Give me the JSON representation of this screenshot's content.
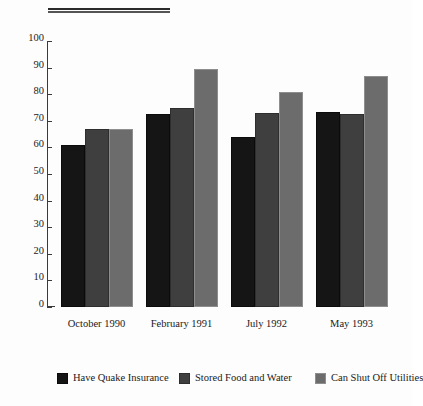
{
  "chart_data": {
    "type": "bar",
    "title": "",
    "subtitle": "",
    "xlabel": "",
    "ylabel": "",
    "ylim": [
      0,
      100
    ],
    "yticks": [
      0,
      10,
      20,
      30,
      40,
      50,
      60,
      70,
      80,
      90,
      100
    ],
    "grid": false,
    "legend_position": "bottom",
    "categories": [
      "October 1990",
      "February 1991",
      "July 1992",
      "May 1993"
    ],
    "series": [
      {
        "name": "Have Quake Insurance",
        "color": "#151515",
        "values": [
          61,
          72.5,
          64,
          73.5
        ]
      },
      {
        "name": "Stored Food and Water",
        "color": "#3f3f3f",
        "values": [
          67,
          75,
          73,
          72.5
        ]
      },
      {
        "name": "Can Shut Off Utilities",
        "color": "#6c6c6c",
        "values": [
          67,
          89.5,
          81,
          87
        ]
      }
    ]
  },
  "axis": {
    "tick_labels": [
      "100",
      "90",
      "80",
      "70",
      "60",
      "50",
      "40",
      "30",
      "20",
      "10",
      "0"
    ]
  },
  "categories_labels": {
    "c0": "October 1990",
    "c1": "February 1991",
    "c2": "July 1992",
    "c3": "May 1993"
  },
  "legend_labels": {
    "l0": "Have Quake Insurance",
    "l1": "Stored Food and Water",
    "l2": "Can Shut Off Utilities"
  }
}
